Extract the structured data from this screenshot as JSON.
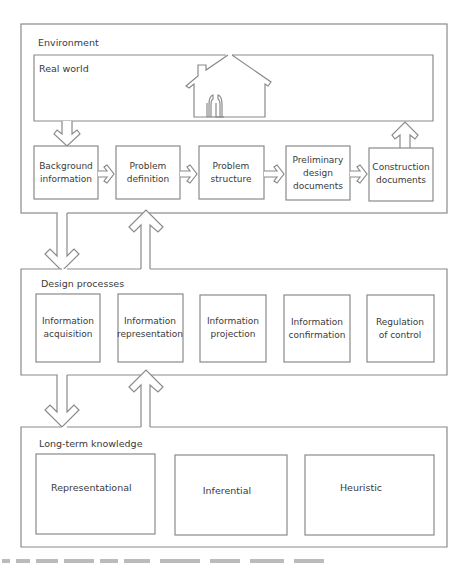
{
  "environment": {
    "label": "Environment",
    "real_world": {
      "label": "Real world",
      "icon": "house-icon"
    },
    "stages": [
      {
        "lines": [
          "Background",
          "information"
        ]
      },
      {
        "lines": [
          "Problem",
          "definition"
        ]
      },
      {
        "lines": [
          "Problem",
          "structure"
        ]
      },
      {
        "lines": [
          "Preliminary",
          "design",
          "documents"
        ]
      },
      {
        "lines": [
          "Construction",
          "documents"
        ]
      }
    ]
  },
  "design_processes": {
    "label": "Design processes",
    "items": [
      {
        "lines": [
          "Information",
          "acquisition"
        ]
      },
      {
        "lines": [
          "Information",
          "representation"
        ]
      },
      {
        "lines": [
          "Information",
          "projection"
        ]
      },
      {
        "lines": [
          "Information",
          "confirmation"
        ]
      },
      {
        "lines": [
          "Regulation",
          "of control"
        ]
      }
    ]
  },
  "long_term_knowledge": {
    "label": "Long-term knowledge",
    "items": [
      {
        "label": "Representational"
      },
      {
        "label": "Inferential"
      },
      {
        "label": "Heuristic"
      }
    ]
  },
  "colors": {
    "stroke": "#8a8a8a",
    "text": "#3a3a3a",
    "background": "#ffffff"
  }
}
